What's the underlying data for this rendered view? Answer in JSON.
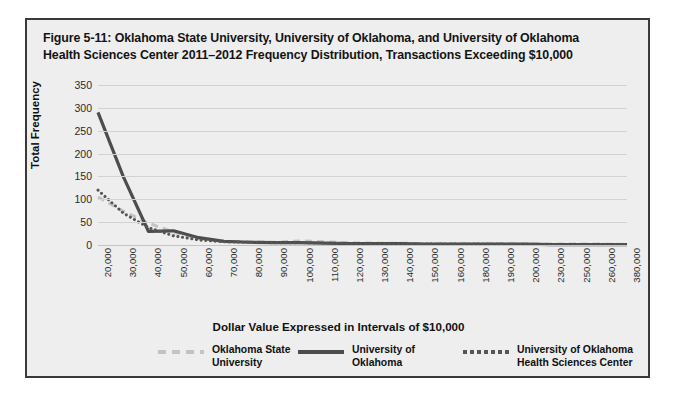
{
  "figure": {
    "title_line1": "Figure 5-11: Oklahoma State University, University of Oklahoma, and University of Oklahoma",
    "title_line2": "Health Sciences Center 2011–2012 Frequency Distribution, Transactions Exceeding $10,000"
  },
  "legend": {
    "items": [
      {
        "label": "Oklahoma State\nUniversity",
        "style": "dashed",
        "color": "#c3c3c3"
      },
      {
        "label": "University of\nOklahoma",
        "style": "solid",
        "color": "#4d4d4d"
      },
      {
        "label": "University of Oklahoma\nHealth Sciences Center",
        "style": "dotted",
        "color": "#555555"
      }
    ]
  },
  "colors": {
    "osu": "#c3c3c3",
    "ou": "#4d4d4d",
    "ouhsc": "#555555",
    "grid": "#d2d2d2",
    "frame": "#3a3a3a",
    "panel": "#eeeeee"
  },
  "chart_data": {
    "type": "line",
    "title": "Figure 5-11: Oklahoma State University, University of Oklahoma, and University of Oklahoma Health Sciences Center 2011–2012 Frequency Distribution, Transactions Exceeding $10,000",
    "xlabel": "Dollar Value Expressed in Intervals of $10,000",
    "ylabel": "Total Frequency",
    "ylim": [
      0,
      350
    ],
    "yticks": [
      0,
      50,
      100,
      150,
      200,
      250,
      300,
      350
    ],
    "grid": true,
    "legend_position": "bottom",
    "categories": [
      "20,000",
      "30,000",
      "40,000",
      "50,000",
      "60,000",
      "70,000",
      "80,000",
      "90,000",
      "100,000",
      "110,000",
      "120,000",
      "130,000",
      "140,000",
      "150,000",
      "160,000",
      "180,000",
      "190,000",
      "200,000",
      "230,000",
      "250,000",
      "260,000",
      "380,000"
    ],
    "series": [
      {
        "name": "Oklahoma State University",
        "style": "dashed",
        "values": [
          105,
          74,
          48,
          28,
          14,
          8,
          7,
          6,
          9,
          7,
          5,
          4,
          4,
          3,
          3,
          3,
          2,
          2,
          2,
          2,
          2,
          1
        ]
      },
      {
        "name": "University of Oklahoma",
        "style": "solid",
        "values": [
          290,
          150,
          30,
          31,
          16,
          8,
          6,
          5,
          5,
          4,
          3,
          3,
          3,
          2,
          2,
          2,
          2,
          2,
          1,
          1,
          1,
          1
        ]
      },
      {
        "name": "University of Oklahoma Health Sciences Center",
        "style": "dotted",
        "values": [
          120,
          70,
          38,
          20,
          11,
          7,
          6,
          5,
          5,
          4,
          3,
          3,
          2,
          2,
          2,
          2,
          2,
          1,
          1,
          1,
          1,
          1
        ]
      }
    ]
  }
}
